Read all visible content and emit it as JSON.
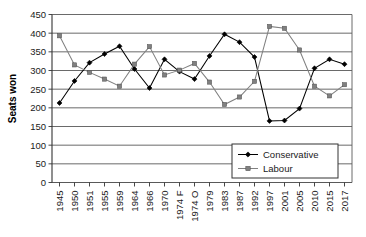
{
  "chart_data": {
    "type": "line",
    "title": "",
    "xlabel": "",
    "ylabel": "Seats won",
    "ylim": [
      0,
      450
    ],
    "ytick_step": 50,
    "yticks": [
      "0",
      "50",
      "100",
      "150",
      "200",
      "250",
      "300",
      "350",
      "400",
      "450"
    ],
    "grid": true,
    "legend_position": "bottom-right",
    "categories": [
      "1945",
      "1950",
      "1951",
      "1955",
      "1959",
      "1964",
      "1966",
      "1970",
      "1974 F",
      "1974 O",
      "1979",
      "1983",
      "1987",
      "1992",
      "1997",
      "2001",
      "2005",
      "2010",
      "2015",
      "2017"
    ],
    "series": [
      {
        "name": "Conservative",
        "color": "#000000",
        "marker": "diamond",
        "values": [
          213,
          272,
          321,
          344,
          365,
          304,
          253,
          330,
          297,
          277,
          339,
          397,
          376,
          336,
          165,
          166,
          198,
          306,
          330,
          317
        ]
      },
      {
        "name": "Labour",
        "color": "#808080",
        "marker": "square",
        "values": [
          393,
          315,
          295,
          277,
          258,
          317,
          364,
          288,
          301,
          319,
          269,
          209,
          229,
          271,
          418,
          413,
          355,
          258,
          232,
          262
        ]
      }
    ],
    "legend": [
      {
        "label": "Conservative",
        "color": "#000000",
        "marker": "diamond"
      },
      {
        "label": "Labour",
        "color": "#808080",
        "marker": "square"
      }
    ]
  }
}
